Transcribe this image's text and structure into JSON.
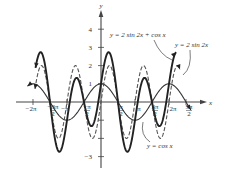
{
  "chart_data": {
    "type": "line",
    "title": "",
    "xlabel": "x",
    "ylabel": "y",
    "xlim": [
      -6.6,
      8.4
    ],
    "ylim": [
      -3.4,
      4.5
    ],
    "grid": false,
    "x_ticks": [
      {
        "value": -6.2832,
        "label": "−2π"
      },
      {
        "value": -4.7124,
        "label": "−3π/2"
      },
      {
        "value": -3.1416,
        "label": "−π"
      },
      {
        "value": -1.5708,
        "label": "−π/2"
      },
      {
        "value": 1.5708,
        "label": "π/2"
      },
      {
        "value": 3.1416,
        "label": "π"
      },
      {
        "value": 4.7124,
        "label": "3π/2"
      },
      {
        "value": 6.2832,
        "label": "2π"
      },
      {
        "value": 7.854,
        "label": "5π/2"
      }
    ],
    "y_ticks": [
      {
        "value": 4,
        "label": "4"
      },
      {
        "value": 3,
        "label": "3"
      },
      {
        "value": 2,
        "label": "2"
      },
      {
        "value": 1,
        "label": "1"
      },
      {
        "value": -1,
        "label": "−1"
      },
      {
        "value": -2,
        "label": "−2"
      },
      {
        "value": -3,
        "label": "−3"
      }
    ],
    "series": [
      {
        "name": "y = cos x",
        "expr": "cos",
        "style": "thin-solid",
        "x_range": [
          -6.8,
          8.3
        ]
      },
      {
        "name": "y = 2 sin 2x",
        "expr": "2sin2x",
        "style": "dashed",
        "x_range": [
          -6.1,
          7.3
        ]
      },
      {
        "name": "y = 2 sin 2x + cos x",
        "expr": "sum",
        "style": "thick-solid",
        "x_range": [
          -6.05,
          6.95
        ]
      }
    ],
    "annotations": [
      {
        "text": "y = 2 sin 2x + cos x",
        "x_px": 110,
        "y_px": 37
      },
      {
        "text": "y = 2 sin 2x",
        "x_px": 175,
        "y_px": 47
      },
      {
        "text": "y = cos x",
        "x_px": 147,
        "y_px": 148
      }
    ]
  }
}
